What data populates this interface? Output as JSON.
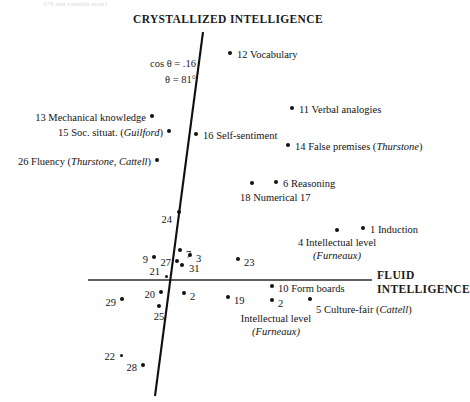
{
  "figure": {
    "cropped_header_fragment": "(79 and variable error)",
    "axes": {
      "crystallized_label": "CRYSTALLIZED INTELLIGENCE",
      "fluid_label_line1": "FLUID",
      "fluid_label_line2": "INTELLIGENCE",
      "horizontal_axis": {
        "x1": 88,
        "y1": 280,
        "x2": 372,
        "y2": 280
      },
      "oblique_axis": {
        "x1": 203,
        "y1": 32,
        "x2": 155,
        "y2": 396
      },
      "axis_color": "#2b2b2b"
    },
    "annotation": {
      "cos_line": "cos θ = .16",
      "theta_line": "θ = 81°"
    }
  },
  "chart_data": {
    "type": "scatter",
    "title": "CRYSTALLIZED INTELLIGENCE",
    "xlabel": "FLUID INTELLIGENCE",
    "ylabel": "CRYSTALLIZED INTELLIGENCE",
    "grid": false,
    "legend": false,
    "note": "Oblique two-factor plot; axes are non-orthogonal, cos theta = .16, theta = 81 degrees",
    "axis_angle_deg": 81,
    "axis_cosine": 0.16,
    "points": [
      {
        "id": 12,
        "label": "12 Vocabulary",
        "x": 230,
        "y": 53,
        "label_x": 237,
        "label_y": 48,
        "align": "left"
      },
      {
        "id": 11,
        "label": "11 Verbal analogies",
        "x": 292,
        "y": 108,
        "label_x": 299,
        "label_y": 103,
        "align": "left"
      },
      {
        "id": 13,
        "label": "13 Mechanical knowledge",
        "x": 152,
        "y": 116,
        "label_x": 146,
        "label_y": 111,
        "align": "right"
      },
      {
        "id": 15,
        "label": "15 Soc. situat. (Guilford)",
        "x": 169,
        "y": 131,
        "label_x": 163,
        "label_y": 126,
        "align": "right",
        "italic_part": "Guilford"
      },
      {
        "id": 16,
        "label": "16 Self-sentiment",
        "x": 196,
        "y": 134,
        "label_x": 203,
        "label_y": 129,
        "align": "left"
      },
      {
        "id": 14,
        "label": "14 False premises (Thurstone)",
        "x": 288,
        "y": 145,
        "label_x": 295,
        "label_y": 140,
        "align": "left",
        "italic_part": "Thurstone"
      },
      {
        "id": 26,
        "label": "26 Fluency (Thurstone, Cattell)",
        "x": 157,
        "y": 160,
        "label_x": 151,
        "label_y": 155,
        "align": "right",
        "italic_part": "Thurstone, Cattell"
      },
      {
        "id": 6,
        "label": "6 Reasoning",
        "x": 276,
        "y": 182,
        "label_x": 283,
        "label_y": 177,
        "align": "left"
      },
      {
        "id": 18,
        "label": "18 Numerical 17",
        "x": 252,
        "y": 183,
        "label_x": 240,
        "label_y": 191,
        "align": "left"
      },
      {
        "id": 24,
        "label": "24",
        "x": 179,
        "y": 212,
        "label_x": 172,
        "label_y": 213,
        "align": "right"
      },
      {
        "id": 1,
        "label": "1 Induction",
        "x": 363,
        "y": 228,
        "label_x": 370,
        "label_y": 223,
        "align": "left"
      },
      {
        "id": 4,
        "label": "4 Intellectual level (Furneaux)",
        "x": 337,
        "y": 230,
        "label_x": 337,
        "label_y": 236,
        "align": "center",
        "italic_part": "Furneaux"
      },
      {
        "id": 7,
        "label": "7",
        "x": 180,
        "y": 250,
        "label_x": 186,
        "label_y": 248,
        "align": "left"
      },
      {
        "id": 3,
        "label": "3",
        "x": 190,
        "y": 255,
        "label_x": 196,
        "label_y": 252,
        "align": "left"
      },
      {
        "id": 9,
        "label": "9",
        "x": 154,
        "y": 257,
        "label_x": 148,
        "label_y": 253,
        "align": "right"
      },
      {
        "id": 27,
        "label": "27",
        "x": 177,
        "y": 261,
        "label_x": 171,
        "label_y": 256,
        "align": "right"
      },
      {
        "id": 31,
        "label": "31",
        "x": 182,
        "y": 265,
        "label_x": 189,
        "label_y": 262,
        "align": "left"
      },
      {
        "id": 23,
        "label": "23",
        "x": 238,
        "y": 259,
        "label_x": 244,
        "label_y": 256,
        "align": "left"
      },
      {
        "id": 21,
        "label": "21",
        "x": 166,
        "y": 276,
        "label_x": 160,
        "label_y": 265,
        "align": "right"
      },
      {
        "id": 20,
        "label": "20",
        "x": 161,
        "y": 292,
        "label_x": 155,
        "label_y": 288,
        "align": "right"
      },
      {
        "id": 2,
        "label": "2",
        "x": 184,
        "y": 293,
        "label_x": 190,
        "label_y": 290,
        "align": "left"
      },
      {
        "id": 19,
        "label": "19",
        "x": 228,
        "y": 297,
        "label_x": 234,
        "label_y": 294,
        "align": "left"
      },
      {
        "id": 10,
        "label": "10 Form boards",
        "x": 272,
        "y": 286,
        "label_x": 278,
        "label_y": 282,
        "align": "left"
      },
      {
        "id": 5,
        "label": "5 Culture-fair (Cattell)",
        "x": 310,
        "y": 299,
        "label_x": 316,
        "label_y": 303,
        "align": "left",
        "italic_part": "Cattell"
      },
      {
        "id": 2.2,
        "label": "2",
        "x": 272,
        "y": 300,
        "label_x": 278,
        "label_y": 297,
        "align": "left"
      },
      {
        "id": 29,
        "label": "29",
        "x": 122,
        "y": 299,
        "label_x": 116,
        "label_y": 296,
        "align": "right"
      },
      {
        "id": 25,
        "label": "25",
        "x": 159,
        "y": 306,
        "label_x": 159,
        "label_y": 310,
        "align": "center"
      },
      {
        "id": 22,
        "label": "22",
        "x": 121,
        "y": 355,
        "label_x": 115,
        "label_y": 350,
        "align": "right"
      },
      {
        "id": 28,
        "label": "28",
        "x": 143,
        "y": 365,
        "label_x": 137,
        "label_y": 361,
        "align": "right"
      }
    ],
    "free_labels": [
      {
        "text": "Intellectual level",
        "sub": "(Furneaux)",
        "x": 276,
        "y": 312,
        "align": "center",
        "italic_sub": true
      }
    ]
  }
}
